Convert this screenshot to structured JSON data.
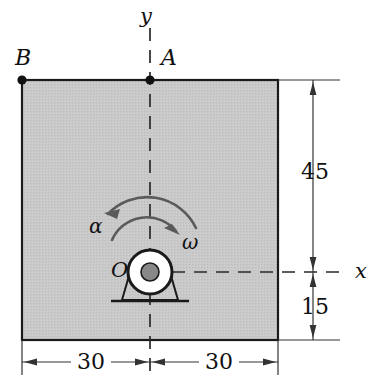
{
  "figure": {
    "type": "engineering-diagram",
    "plate": {
      "fill_color": "#c6c6c6",
      "edge_color": "#1a1a1a"
    },
    "points": [
      {
        "name": "point-b",
        "label": "B",
        "position": "top-left-corner"
      },
      {
        "name": "point-a",
        "label": "A",
        "position": "top-edge-at-y-axis"
      },
      {
        "name": "point-o",
        "label": "O",
        "position": "bearing-center"
      }
    ],
    "axes": [
      {
        "name": "y-axis",
        "label": "y",
        "orientation": "vertical",
        "style": "dashed"
      },
      {
        "name": "x-axis",
        "label": "x",
        "orientation": "horizontal",
        "style": "dashed"
      }
    ],
    "motion": [
      {
        "name": "angular-acceleration",
        "label": "α",
        "sense": "counterclockwise"
      },
      {
        "name": "angular-velocity",
        "label": "ω",
        "sense": "clockwise"
      }
    ],
    "dimensions": [
      {
        "name": "dim-left-width",
        "value": "30",
        "orientation": "horizontal"
      },
      {
        "name": "dim-right-width",
        "value": "30",
        "orientation": "horizontal"
      },
      {
        "name": "dim-upper-height",
        "value": "45",
        "orientation": "vertical"
      },
      {
        "name": "dim-lower-height",
        "value": "15",
        "orientation": "vertical"
      }
    ]
  }
}
